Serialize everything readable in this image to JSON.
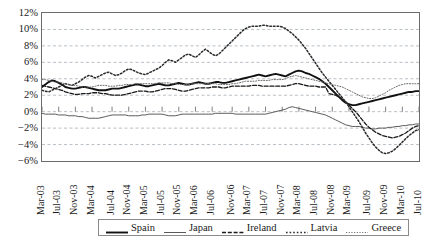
{
  "chart_data": {
    "type": "line",
    "title": "",
    "subtitle": "",
    "xlabel": "",
    "ylabel": "",
    "ylim": [
      -6,
      12
    ],
    "ytick_step": 2,
    "ytick_labels": [
      "12%",
      "10%",
      "8%",
      "6%",
      "4%",
      "2%",
      "0%",
      "−2%",
      "−4%",
      "−6%"
    ],
    "ytick_values": [
      12,
      10,
      8,
      6,
      4,
      2,
      0,
      -2,
      -4,
      -6
    ],
    "grid": "horizontal-dashed",
    "legend_position": "bottom",
    "x_tick_labels": [
      "Mar-03",
      "Jul-03",
      "Nov-03",
      "Mar-04",
      "Jul-04",
      "Nov-04",
      "Mar-05",
      "Jul-05",
      "Nov-05",
      "Mar-06",
      "Jul-06",
      "Nov-06",
      "Mar-07",
      "Jul-07",
      "Nov-07",
      "Mar-08",
      "Jul-08",
      "Nov-08",
      "Mar-09",
      "Jul-09",
      "Nov-09",
      "Mar-10",
      "Jul-10"
    ],
    "x_tick_count": 23,
    "x_tick_interval_months": 4,
    "x_range": [
      "Mar-03",
      "Jul-10"
    ],
    "series": [
      {
        "name": "Spain",
        "style": "solid-thick",
        "color": "#111111",
        "values": [
          3.0,
          3.3,
          3.6,
          3.8,
          3.7,
          3.5,
          3.3,
          3.0,
          2.9,
          2.8,
          2.8,
          2.9,
          3.0,
          3.0,
          2.9,
          2.8,
          2.7,
          2.6,
          2.6,
          2.6,
          2.7,
          2.8,
          2.8,
          2.8,
          2.9,
          3.0,
          3.1,
          3.2,
          3.3,
          3.3,
          3.2,
          3.1,
          3.1,
          3.2,
          3.3,
          3.4,
          3.3,
          3.2,
          3.2,
          3.3,
          3.4,
          3.5,
          3.4,
          3.3,
          3.3,
          3.4,
          3.5,
          3.6,
          3.5,
          3.4,
          3.4,
          3.5,
          3.6,
          3.6,
          3.5,
          3.5,
          3.6,
          3.7,
          3.8,
          3.9,
          4.0,
          4.1,
          4.2,
          4.3,
          4.4,
          4.5,
          4.4,
          4.3,
          4.4,
          4.5,
          4.6,
          4.5,
          4.4,
          4.3,
          4.5,
          4.7,
          4.9,
          5.0,
          4.9,
          4.7,
          4.6,
          4.4,
          4.2,
          4.0,
          3.7,
          3.4,
          3.0,
          2.6,
          2.2,
          1.8,
          1.4,
          1.1,
          0.9,
          0.8,
          0.8,
          0.9,
          1.0,
          1.1,
          1.2,
          1.3,
          1.4,
          1.5,
          1.6,
          1.7,
          1.8,
          1.9,
          2.0,
          2.1,
          2.2,
          2.3,
          2.4,
          2.4,
          2.5,
          2.5
        ]
      },
      {
        "name": "Japan",
        "style": "solid-thin",
        "color": "#5a5a5a",
        "values": [
          -0.2,
          -0.3,
          -0.3,
          -0.3,
          -0.3,
          -0.4,
          -0.4,
          -0.4,
          -0.5,
          -0.5,
          -0.5,
          -0.6,
          -0.6,
          -0.7,
          -0.8,
          -0.8,
          -0.8,
          -0.8,
          -0.7,
          -0.6,
          -0.5,
          -0.4,
          -0.4,
          -0.4,
          -0.4,
          -0.4,
          -0.5,
          -0.5,
          -0.5,
          -0.5,
          -0.4,
          -0.4,
          -0.3,
          -0.3,
          -0.3,
          -0.3,
          -0.3,
          -0.4,
          -0.5,
          -0.5,
          -0.5,
          -0.4,
          -0.3,
          -0.3,
          -0.3,
          -0.3,
          -0.3,
          -0.3,
          -0.3,
          -0.3,
          -0.3,
          -0.3,
          -0.2,
          -0.2,
          -0.2,
          -0.2,
          -0.2,
          -0.2,
          -0.3,
          -0.3,
          -0.3,
          -0.3,
          -0.3,
          -0.3,
          -0.3,
          -0.3,
          -0.3,
          -0.3,
          -0.2,
          -0.1,
          0.0,
          0.1,
          0.2,
          0.3,
          0.5,
          0.6,
          0.5,
          0.4,
          0.3,
          0.2,
          0.1,
          0.0,
          -0.1,
          -0.2,
          -0.3,
          -0.4,
          -0.6,
          -0.8,
          -1.0,
          -1.2,
          -1.4,
          -1.6,
          -1.7,
          -1.8,
          -1.8,
          -1.8,
          -1.9,
          -2.0,
          -2.0,
          -2.1,
          -2.1,
          -2.0,
          -2.0,
          -2.0,
          -1.9,
          -1.9,
          -1.8,
          -1.8,
          -1.7,
          -1.7,
          -1.6,
          -1.6,
          -1.5,
          -1.5
        ]
      },
      {
        "name": "Ireland",
        "style": "dashed",
        "color": "#1a1a1a",
        "values": [
          3.2,
          3.1,
          3.0,
          2.9,
          2.8,
          2.7,
          2.6,
          2.4,
          2.3,
          2.2,
          2.1,
          2.1,
          2.2,
          2.2,
          2.2,
          2.3,
          2.3,
          2.3,
          2.2,
          2.2,
          2.1,
          2.0,
          2.0,
          2.0,
          2.0,
          2.1,
          2.2,
          2.3,
          2.4,
          2.5,
          2.5,
          2.5,
          2.4,
          2.4,
          2.5,
          2.6,
          2.7,
          2.8,
          2.8,
          2.8,
          2.7,
          2.6,
          2.5,
          2.5,
          2.6,
          2.7,
          2.8,
          2.9,
          2.9,
          2.9,
          2.9,
          3.0,
          3.0,
          3.0,
          2.9,
          2.9,
          3.0,
          3.1,
          3.1,
          3.1,
          3.1,
          3.1,
          3.1,
          3.2,
          3.2,
          3.2,
          3.1,
          3.1,
          3.1,
          3.1,
          3.1,
          3.1,
          3.1,
          3.1,
          3.2,
          3.3,
          3.4,
          3.4,
          3.3,
          3.2,
          3.1,
          3.1,
          3.1,
          3.0,
          3.0,
          3.0,
          2.2,
          2.1,
          2.0,
          1.8,
          1.5,
          1.2,
          0.8,
          0.4,
          0.0,
          -0.5,
          -1.0,
          -1.5,
          -1.9,
          -2.2,
          -2.5,
          -2.7,
          -2.9,
          -3.0,
          -3.1,
          -3.2,
          -3.1,
          -3.0,
          -2.8,
          -2.6,
          -2.3,
          -2.0,
          -1.8,
          -1.7
        ]
      },
      {
        "name": "Latvia",
        "style": "dotted-coarse",
        "color": "#2a2a2a",
        "values": [
          2.6,
          2.5,
          2.4,
          2.6,
          2.8,
          3.0,
          3.2,
          3.4,
          3.3,
          3.2,
          3.4,
          3.6,
          3.9,
          4.2,
          4.4,
          4.3,
          4.1,
          4.3,
          4.5,
          4.7,
          4.8,
          4.6,
          4.4,
          4.5,
          4.7,
          5.0,
          5.2,
          5.1,
          4.9,
          4.7,
          4.6,
          4.5,
          4.7,
          4.9,
          5.1,
          5.3,
          5.6,
          6.0,
          6.3,
          6.2,
          6.0,
          6.3,
          6.6,
          6.9,
          7.0,
          6.8,
          6.6,
          6.9,
          7.3,
          7.6,
          7.3,
          7.0,
          6.8,
          7.0,
          7.4,
          7.8,
          8.2,
          8.6,
          9.0,
          9.4,
          9.8,
          10.1,
          10.3,
          10.4,
          10.4,
          10.4,
          10.5,
          10.5,
          10.4,
          10.4,
          10.4,
          10.4,
          10.3,
          10.1,
          9.8,
          9.5,
          9.1,
          8.7,
          8.2,
          7.7,
          7.1,
          6.5,
          5.9,
          5.3,
          4.7,
          4.2,
          3.7,
          3.2,
          2.7,
          2.2,
          1.7,
          1.2,
          0.6,
          0.0,
          -0.6,
          -1.2,
          -1.9,
          -2.6,
          -3.2,
          -3.8,
          -4.3,
          -4.7,
          -5.0,
          -5.1,
          -5.0,
          -4.8,
          -4.5,
          -4.1,
          -3.7,
          -3.3,
          -2.9,
          -2.6,
          -2.3,
          -2.2
        ]
      },
      {
        "name": "Greece",
        "style": "dotted-fine",
        "color": "#6a6a6a",
        "values": [
          3.9,
          3.9,
          3.8,
          3.7,
          3.6,
          3.6,
          3.5,
          3.4,
          3.3,
          3.2,
          3.2,
          3.1,
          3.0,
          3.0,
          3.0,
          3.0,
          3.1,
          3.2,
          3.2,
          3.2,
          3.1,
          3.1,
          3.1,
          3.2,
          3.2,
          3.3,
          3.3,
          3.3,
          3.4,
          3.4,
          3.4,
          3.4,
          3.4,
          3.4,
          3.4,
          3.5,
          3.5,
          3.5,
          3.5,
          3.4,
          3.4,
          3.3,
          3.3,
          3.3,
          3.3,
          3.4,
          3.4,
          3.4,
          3.4,
          3.4,
          3.4,
          3.4,
          3.4,
          3.3,
          3.3,
          3.3,
          3.3,
          3.4,
          3.4,
          3.5,
          3.6,
          3.7,
          3.7,
          3.7,
          3.7,
          3.8,
          3.8,
          3.8,
          3.8,
          3.9,
          3.9,
          3.9,
          3.9,
          4.0,
          4.2,
          4.3,
          4.4,
          4.3,
          4.2,
          4.1,
          4.0,
          3.9,
          3.8,
          3.7,
          3.6,
          3.5,
          3.4,
          3.3,
          3.2,
          3.1,
          3.0,
          2.8,
          2.6,
          2.4,
          2.2,
          2.0,
          1.8,
          1.7,
          1.6,
          1.6,
          1.7,
          1.9,
          2.1,
          2.3,
          2.6,
          2.8,
          3.0,
          3.2,
          3.3,
          3.4,
          3.4,
          3.4,
          3.4,
          3.4
        ]
      }
    ]
  },
  "legend": {
    "items": [
      {
        "label": "Spain"
      },
      {
        "label": "Japan"
      },
      {
        "label": "Ireland"
      },
      {
        "label": "Latvia"
      },
      {
        "label": "Greece"
      }
    ]
  }
}
